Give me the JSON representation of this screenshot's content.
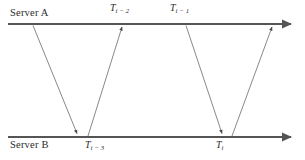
{
  "diagram": {
    "type": "timing-diagram",
    "width": 305,
    "height": 160,
    "background_color": "#ffffff",
    "timeline_color": "#555555",
    "message_arrow_color": "#777777",
    "text_color": "#2b2b2b",
    "timelines": [
      {
        "name": "server-a",
        "label": "Server A",
        "label_position": "above-left",
        "y": 24,
        "x_start": 8,
        "x_end": 293,
        "arrowhead": "right"
      },
      {
        "name": "server-b",
        "label": "Server B",
        "label_position": "below-left",
        "y": 137,
        "x_start": 8,
        "x_end": 293,
        "arrowhead": "right"
      }
    ],
    "timestamps": [
      {
        "name": "t-i-3",
        "base": "T",
        "subscript": "i − 3",
        "text": "Ti−3",
        "timeline": "server-b",
        "position": "below",
        "x": 77
      },
      {
        "name": "t-i-2",
        "base": "T",
        "subscript": "i − 2",
        "text": "Ti−2",
        "timeline": "server-a",
        "position": "above",
        "x": 122
      },
      {
        "name": "t-i-1",
        "base": "T",
        "subscript": "i − 1",
        "text": "Ti−1",
        "timeline": "server-a",
        "position": "above",
        "x": 186
      },
      {
        "name": "t-i",
        "base": "T",
        "subscript": "i",
        "text": "Ti",
        "timeline": "server-b",
        "position": "below",
        "x": 222
      }
    ],
    "messages": [
      {
        "name": "message-a-to-b-first",
        "direction": "down",
        "from": {
          "timeline": "server-a",
          "x": 33,
          "y": 25
        },
        "to": {
          "timeline": "server-b",
          "x": 77,
          "y": 136
        },
        "arrowhead": "end"
      },
      {
        "name": "message-b-to-a-first",
        "direction": "up",
        "from": {
          "timeline": "server-b",
          "x": 88,
          "y": 136
        },
        "to": {
          "timeline": "server-a",
          "x": 122,
          "y": 25
        },
        "arrowhead": "end"
      },
      {
        "name": "message-a-to-b-second",
        "direction": "down",
        "from": {
          "timeline": "server-a",
          "x": 186,
          "y": 25
        },
        "to": {
          "timeline": "server-b",
          "x": 222,
          "y": 136
        },
        "arrowhead": "end"
      },
      {
        "name": "message-b-to-a-second",
        "direction": "up",
        "from": {
          "timeline": "server-b",
          "x": 232,
          "y": 136
        },
        "to": {
          "timeline": "server-a",
          "x": 272,
          "y": 25
        },
        "arrowhead": "end"
      }
    ]
  }
}
